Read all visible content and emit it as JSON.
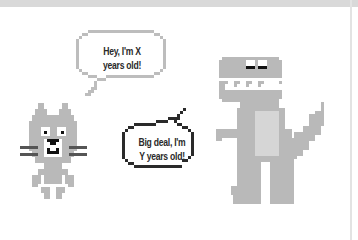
{
  "illustration": {
    "colors": {
      "background": "#ffffff",
      "top_bar": "#d9d9d9",
      "figure_gray": "#b9b9b9",
      "belly_light": "#d6d6d6",
      "bubble_1_outline": "#bdbdbd",
      "bubble_2_outline": "#2a2a2a",
      "eye_black": "#111111"
    },
    "cat": {
      "name": "pixel-cat",
      "speech": {
        "line_1": "Hey, I'm X",
        "line_2": "years old!"
      }
    },
    "dinosaur": {
      "name": "pixel-dinosaur",
      "speech": {
        "line_1": "Big deal, I'm",
        "line_2": "Y years old!"
      }
    }
  }
}
